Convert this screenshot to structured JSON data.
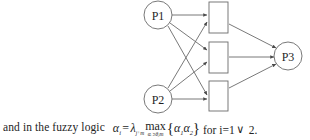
{
  "diagram": {
    "type": "network-diagram",
    "stroke_color": "#555555",
    "node_fill": "#ffffff",
    "input_nodes": [
      {
        "id": "p1",
        "label": "P1",
        "shape": "circle",
        "cx": 158,
        "cy": 15,
        "r": 14
      },
      {
        "id": "p2",
        "label": "P2",
        "shape": "circle",
        "cx": 158,
        "cy": 99,
        "r": 14
      }
    ],
    "hidden_nodes": [
      {
        "id": "h1",
        "label": "",
        "shape": "rectangle",
        "x": 209,
        "y": 2,
        "w": 19,
        "h": 31
      },
      {
        "id": "h2",
        "label": "",
        "shape": "rectangle",
        "x": 209,
        "y": 42,
        "w": 19,
        "h": 31
      },
      {
        "id": "h3",
        "label": "",
        "shape": "rectangle",
        "x": 209,
        "y": 81,
        "w": 19,
        "h": 30
      }
    ],
    "output_nodes": [
      {
        "id": "p3",
        "label": "P3",
        "shape": "circle",
        "cx": 288,
        "cy": 56,
        "r": 14
      }
    ],
    "edges": [
      {
        "from": "p1",
        "to": "h1"
      },
      {
        "from": "p1",
        "to": "h2"
      },
      {
        "from": "p1",
        "to": "h3"
      },
      {
        "from": "p2",
        "to": "h1"
      },
      {
        "from": "p2",
        "to": "h2"
      },
      {
        "from": "p2",
        "to": "h3"
      },
      {
        "from": "h1",
        "to": "p3"
      },
      {
        "from": "h2",
        "to": "p3"
      },
      {
        "from": "h3",
        "to": "p3"
      }
    ]
  },
  "caption": {
    "lead_text": "and in the fuzzy logic",
    "formula": {
      "lhs_symbol": "α",
      "lhs_subscript": "i",
      "equals": "=",
      "lambda_symbol": "λ",
      "lambda_subscript": "j⁺m",
      "max_label": "max",
      "max_subscript": "αᵢ ≥θⱼm",
      "brace_open": "{",
      "arg1_symbol": "α",
      "arg1_subscript": "1",
      "arg2_symbol": "α",
      "arg2_subscript": "2",
      "brace_close": "}",
      "tail_text": "for i=1",
      "or_symbol": "∨",
      "end_text": "2."
    }
  }
}
